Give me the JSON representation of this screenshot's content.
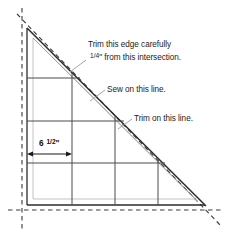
{
  "figure": {
    "background_color": "#ffffff"
  },
  "annotations": {
    "trim_edge": {
      "line1": "Trim this edge carefully",
      "fraction": "1/4",
      "line2_rest": "\" from this intersection."
    },
    "sew": {
      "text": "Sew on this line."
    },
    "trim_line": {
      "text": "Trim on this line."
    },
    "dimension": {
      "whole": "6",
      "fraction": "1/2",
      "unit": "\""
    }
  },
  "colors": {
    "line_dark": "#2b2b2b",
    "line_gray": "#9a9a9a",
    "line_light": "#c9c9c9",
    "grid": "#4a4a4a",
    "text": "#1b1b1b"
  },
  "geometry": {
    "triangle_apex": [
      27,
      28
    ],
    "triangle_bottom_left": [
      27,
      205
    ],
    "triangle_bottom_right": [
      205,
      205
    ],
    "grid_verticals_x": [
      27,
      72,
      115,
      158
    ],
    "grid_horizontals_y": [
      78,
      121,
      163,
      205
    ],
    "dimension_arrow": {
      "x1": 27,
      "x2": 72,
      "y": 154
    }
  }
}
